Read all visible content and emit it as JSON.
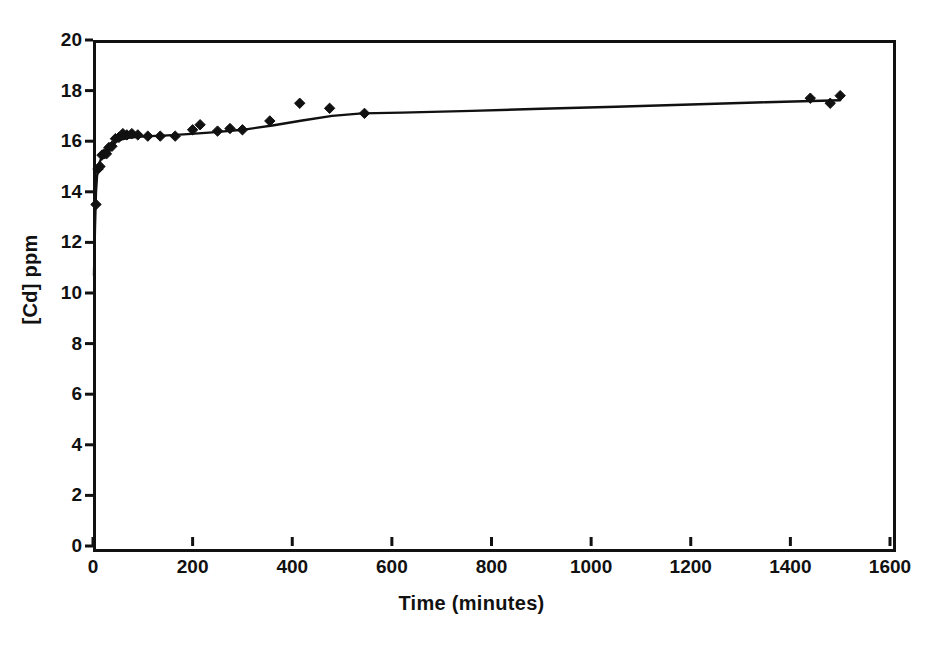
{
  "chart_data": {
    "type": "scatter",
    "title": "",
    "xlabel": "Time (minutes)",
    "ylabel": "[Cd] ppm",
    "xlim": [
      0,
      1600
    ],
    "ylim": [
      0,
      20
    ],
    "xticks": [
      0,
      200,
      400,
      600,
      800,
      1000,
      1200,
      1400,
      1600
    ],
    "yticks": [
      0,
      2,
      4,
      6,
      8,
      10,
      12,
      14,
      16,
      18,
      20
    ],
    "grid": false,
    "legend": null,
    "series": [
      {
        "name": "measured",
        "type": "scatter",
        "marker": "diamond",
        "color": "#111111",
        "points": [
          [
            6,
            13.5
          ],
          [
            10,
            14.9
          ],
          [
            14,
            15.0
          ],
          [
            18,
            15.45
          ],
          [
            22,
            15.5
          ],
          [
            27,
            15.5
          ],
          [
            32,
            15.75
          ],
          [
            38,
            15.8
          ],
          [
            45,
            16.1
          ],
          [
            52,
            16.15
          ],
          [
            60,
            16.3
          ],
          [
            68,
            16.25
          ],
          [
            78,
            16.3
          ],
          [
            90,
            16.25
          ],
          [
            110,
            16.2
          ],
          [
            135,
            16.2
          ],
          [
            165,
            16.2
          ],
          [
            200,
            16.45
          ],
          [
            215,
            16.65
          ],
          [
            250,
            16.4
          ],
          [
            275,
            16.5
          ],
          [
            300,
            16.45
          ],
          [
            355,
            16.8
          ],
          [
            415,
            17.5
          ],
          [
            475,
            17.3
          ],
          [
            545,
            17.1
          ],
          [
            1440,
            17.7
          ],
          [
            1480,
            17.5
          ],
          [
            1500,
            17.8
          ]
        ]
      },
      {
        "name": "model",
        "type": "line",
        "color": "#111111",
        "points": [
          [
            2,
            10.7
          ],
          [
            4,
            12.6
          ],
          [
            6,
            14.0
          ],
          [
            8,
            14.6
          ],
          [
            10,
            14.9
          ],
          [
            13,
            15.15
          ],
          [
            17,
            15.35
          ],
          [
            22,
            15.55
          ],
          [
            28,
            15.7
          ],
          [
            36,
            15.85
          ],
          [
            46,
            15.98
          ],
          [
            58,
            16.07
          ],
          [
            72,
            16.13
          ],
          [
            90,
            16.17
          ],
          [
            115,
            16.2
          ],
          [
            150,
            16.23
          ],
          [
            190,
            16.28
          ],
          [
            240,
            16.35
          ],
          [
            300,
            16.45
          ],
          [
            360,
            16.62
          ],
          [
            420,
            16.82
          ],
          [
            480,
            17.0
          ],
          [
            540,
            17.1
          ],
          [
            620,
            17.13
          ],
          [
            760,
            17.2
          ],
          [
            900,
            17.28
          ],
          [
            1050,
            17.36
          ],
          [
            1200,
            17.45
          ],
          [
            1350,
            17.54
          ],
          [
            1500,
            17.62
          ]
        ]
      }
    ]
  },
  "axes": {
    "x": {
      "tick_labels": [
        "0",
        "200",
        "400",
        "600",
        "800",
        "1000",
        "1200",
        "1400",
        "1600"
      ],
      "title": "Time (minutes)"
    },
    "y": {
      "tick_labels": [
        "0",
        "2",
        "4",
        "6",
        "8",
        "10",
        "12",
        "14",
        "16",
        "18",
        "20"
      ],
      "title": "[Cd] ppm"
    }
  },
  "style": {
    "axis_color": "#111111",
    "marker_color": "#111111",
    "line_color": "#111111",
    "background": "#ffffff"
  }
}
